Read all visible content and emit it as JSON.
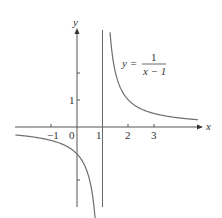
{
  "chart_data": {
    "type": "line",
    "title": "",
    "equation": {
      "lhs": "y =",
      "numerator": "1",
      "denominator": "x − 1"
    },
    "xlabel": "x",
    "ylabel": "y",
    "xlim": [
      -3,
      5
    ],
    "ylim": [
      -3.5,
      3.6
    ],
    "x_ticks": [
      "−1",
      "0",
      "1",
      "2",
      "3"
    ],
    "y_ticks": [
      "1"
    ],
    "vertical_asymptote": 1,
    "series": [
      {
        "name": "y = 1/(x−1)",
        "function": "1/(x-1)",
        "color": "#6e6e6e"
      }
    ],
    "grid": false
  }
}
